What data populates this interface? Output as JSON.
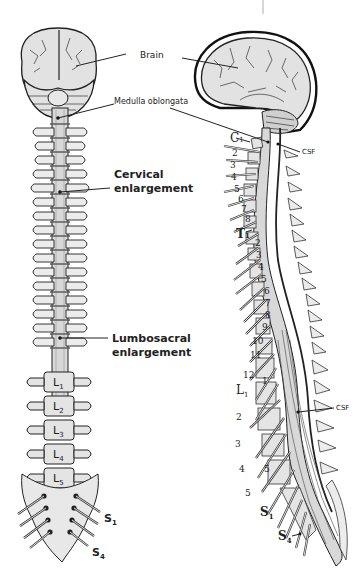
{
  "figure": {
    "anterior_view": {
      "labels": {
        "brain": "Brain",
        "medulla": "Medulla oblongata",
        "cervical_line1": "Cervical",
        "cervical_line2": "enlargement",
        "lumbosacral_line1": "Lumbosacral",
        "lumbosacral_line2": "enlargement"
      },
      "lumbar": [
        {
          "letter": "L",
          "sub": "1"
        },
        {
          "letter": "L",
          "sub": "2"
        },
        {
          "letter": "L",
          "sub": "3"
        },
        {
          "letter": "L",
          "sub": "4"
        },
        {
          "letter": "L",
          "sub": "5"
        }
      ],
      "sacral": [
        {
          "letter": "S",
          "sub": "1"
        },
        {
          "letter": "S",
          "sub": "4"
        }
      ]
    },
    "lateral_view": {
      "labels": {
        "c1_letter": "C",
        "c1_sub": "1",
        "csf_upper": "CSF",
        "t1_letter": "T",
        "t1_sub": "1",
        "l1_letter": "L",
        "l1_sub": "1",
        "csf_lower": "CSF",
        "s1_letter": "S",
        "s1_sub": "1",
        "s4_letter": "S",
        "s4_sub": "4",
        "vertebra_1": "1",
        "vertebra_5": "5"
      },
      "cervical_numbers": [
        "2",
        "3",
        "4",
        "5",
        "6",
        "7",
        "8"
      ],
      "thoracic_numbers": [
        "2",
        "3",
        "4",
        "5",
        "6",
        "7",
        "8",
        "9",
        "10",
        "11",
        "12"
      ],
      "lumbar_numbers": [
        "2",
        "3",
        "4",
        "5"
      ]
    }
  }
}
